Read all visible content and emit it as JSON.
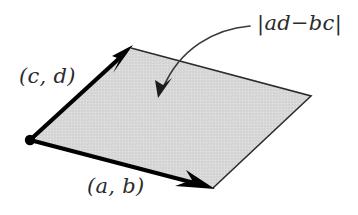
{
  "figure": {
    "background_color": "#ffffff",
    "fill_color": "#d6d6d6",
    "stroke_color": "#000000",
    "thin_stroke_color": "#2b2b2b",
    "label_color": "#2b2b2b",
    "width": 358,
    "height": 215
  },
  "labels": {
    "vector_cd": "(c, d)",
    "vector_ab": "(a, b)",
    "area": "|ad−bc|"
  },
  "geometry": {
    "origin": {
      "x": 30,
      "y": 140
    },
    "vertex_top": {
      "x": 131,
      "y": 48
    },
    "vertex_right": {
      "x": 311,
      "y": 96
    },
    "vertex_bottom": {
      "x": 213,
      "y": 188
    },
    "origin_dot_radius": 5,
    "thick_stroke_width": 4,
    "thin_stroke_width": 1.6
  },
  "annotation_arrow": {
    "start": {
      "x": 250,
      "y": 26
    },
    "control": {
      "x": 196,
      "y": 34
    },
    "end": {
      "x": 161,
      "y": 92
    },
    "head_tip": {
      "x": 158,
      "y": 97
    },
    "stroke_width": 1.6
  }
}
